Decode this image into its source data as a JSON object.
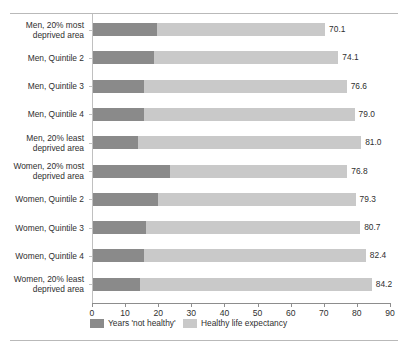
{
  "chart_data": {
    "type": "bar",
    "orientation": "horizontal",
    "stacked": true,
    "title": "",
    "subtitle": "",
    "xlabel": "",
    "ylabel": "",
    "xlim": [
      0,
      90
    ],
    "xticks": [
      0,
      10,
      20,
      30,
      40,
      50,
      60,
      70,
      80,
      90
    ],
    "xtick_labels": [
      "0",
      "10",
      "20",
      "30",
      "40",
      "50",
      "60",
      "70",
      "80",
      "90"
    ],
    "grid": false,
    "legend_position": "bottom",
    "categories": [
      "Men, 20% most\ndeprived area",
      "Men, Quintile 2",
      "Men, Quintile 3",
      "Men, Quintile 4",
      "Men, 20% least\ndeprived area",
      "Women, 20% most\ndeprived area",
      "Women, Quintile 2",
      "Women, Quintile 3",
      "Women, Quintile 4",
      "Women, 20% least\ndeprived area"
    ],
    "series": [
      {
        "name": "Years 'not healthy'",
        "color": "#8a8a8a",
        "values": [
          19.3,
          18.4,
          15.4,
          15.4,
          13.6,
          23.3,
          19.6,
          16.0,
          15.4,
          14.2
        ]
      },
      {
        "name": "Healthy life expectancy",
        "color": "#c9c9c9",
        "values": [
          50.8,
          55.7,
          61.2,
          63.6,
          67.4,
          53.5,
          59.7,
          64.7,
          67.0,
          70.0
        ]
      }
    ],
    "totals": [
      70.1,
      74.1,
      76.6,
      79.0,
      81.0,
      76.8,
      79.3,
      80.7,
      82.4,
      84.2
    ],
    "total_labels": [
      "70.1",
      "74.1",
      "76.6",
      "79.0",
      "81.0",
      "76.8",
      "79.3",
      "80.7",
      "82.4",
      "84.2"
    ],
    "legend": [
      {
        "label": "Years 'not healthy'",
        "color": "#8a8a8a"
      },
      {
        "label": "Healthy life expectancy",
        "color": "#c9c9c9"
      }
    ]
  },
  "colors": {
    "dark_gray": "#8a8a8a",
    "light_gray": "#c9c9c9",
    "axis": "#8d8d8d",
    "rule": "#b9b9b9",
    "text": "#2f2f2f",
    "background": "#ffffff"
  }
}
